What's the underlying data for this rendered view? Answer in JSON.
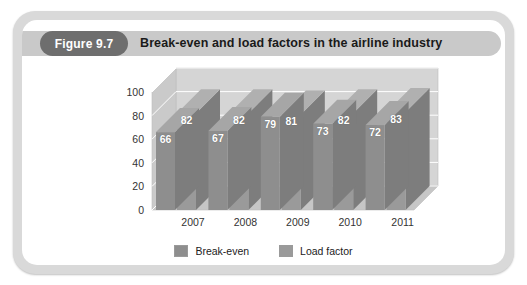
{
  "figure": {
    "badge": "Figure 9.7",
    "title": "Break-even and load factors in the airline industry"
  },
  "colors": {
    "frame": "#d9d9d9",
    "panel": "#ffffff",
    "header_band": "#c9c9c9",
    "badge": "#6e6e6e",
    "break_even_bar": "#8e8e8e",
    "load_factor_bar": "#9a9a9a",
    "wall": "#d5d5d5",
    "floor": "#c6c6c6",
    "gridline": "#ffffff"
  },
  "chart_data": {
    "type": "bar",
    "title": "Break-even and load factors in the airline industry",
    "xlabel": "",
    "ylabel": "",
    "ylim": [
      0,
      100
    ],
    "yticks": [
      0,
      20,
      40,
      60,
      80,
      100
    ],
    "grid": true,
    "legend_position": "bottom",
    "three_d": true,
    "categories": [
      "2007",
      "2008",
      "2009",
      "2010",
      "2011"
    ],
    "series": [
      {
        "name": "Break-even",
        "values": [
          66,
          67,
          79,
          73,
          72
        ]
      },
      {
        "name": "Load factor",
        "values": [
          82,
          82,
          81,
          82,
          83
        ]
      }
    ]
  },
  "legend": [
    {
      "label": "Break-even",
      "color": "#8e8e8e"
    },
    {
      "label": "Load factor",
      "color": "#9a9a9a"
    }
  ]
}
